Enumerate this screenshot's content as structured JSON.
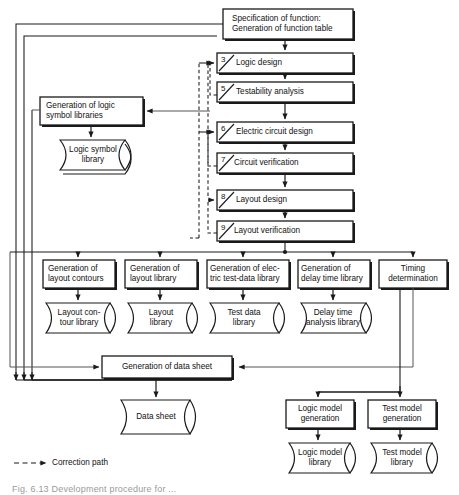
{
  "figure": {
    "caption": "Fig. 6.13  Development procedure for ... ",
    "legend": {
      "marker": "dashed-arrow",
      "label": "Correction path"
    }
  },
  "nodes": {
    "spec": {
      "label": "Specification of function:\nGeneration of function table",
      "number": ""
    },
    "logic_design": {
      "label": "Logic design",
      "number": "3"
    },
    "testability": {
      "label": "Testability analysis",
      "number": "5"
    },
    "electric_circuit": {
      "label": "Electric circuit design",
      "number": "6"
    },
    "circuit_verification": {
      "label": "Circuit verification",
      "number": "7"
    },
    "layout_design": {
      "label": "Layout design",
      "number": "8"
    },
    "layout_verification": {
      "label": "Layout verification",
      "number": "9"
    },
    "gen_logic_symbol": {
      "label": "Generation of logic\nsymbol libraries",
      "number": ""
    },
    "logic_symbol_library": {
      "label": "Logic symbol\nlibrary",
      "number": ""
    },
    "gen_layout_contours": {
      "label": "Generation of\nlayout contours",
      "number": ""
    },
    "layout_contour_library": {
      "label": "Layout con-\ntour library",
      "number": ""
    },
    "gen_layout_library": {
      "label": "Generation of\nlayout library",
      "number": ""
    },
    "layout_library": {
      "label": "Layout\nlibrary",
      "number": ""
    },
    "gen_test_data": {
      "label": "Generation of elec-\ntric test-data library",
      "number": ""
    },
    "test_data_library": {
      "label": "Test data\nlibrary",
      "number": ""
    },
    "gen_delay_time": {
      "label": "Generation of\ndelay time library",
      "number": ""
    },
    "delay_time_library": {
      "label": "Delay time\nanalysis library",
      "number": ""
    },
    "timing_determination": {
      "label": "Timing\ndetermination",
      "number": ""
    },
    "gen_data_sheet": {
      "label": "Generation of data sheet",
      "number": ""
    },
    "data_sheet": {
      "label": "Data sheet",
      "number": ""
    },
    "logic_model_generation": {
      "label": "Logic model\ngeneration",
      "number": ""
    },
    "logic_model_library": {
      "label": "Logic model\nlibrary",
      "number": ""
    },
    "test_model_generation": {
      "label": "Test model\ngeneration",
      "number": ""
    },
    "test_model_library": {
      "label": "Test model\nlibrary",
      "number": ""
    }
  },
  "colors": {
    "stroke": "#1a1a1a",
    "box_fill": "#ffffff",
    "background": "#ffffff",
    "caption": "#9a9a9a",
    "thin_line": "#555555"
  }
}
